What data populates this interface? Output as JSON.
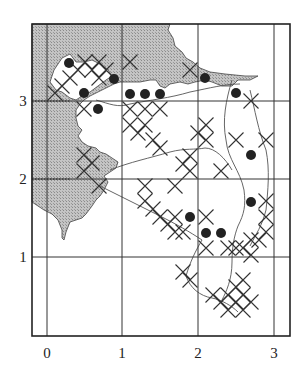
{
  "map": {
    "type": "grid-distribution-map",
    "frame": {
      "left": 32,
      "top": 24,
      "right": 290,
      "bottom": 336
    },
    "x_ticks": [
      {
        "label": "0",
        "px": 47
      },
      {
        "label": "1",
        "px": 122
      },
      {
        "label": "2",
        "px": 198
      },
      {
        "label": "3",
        "px": 274
      }
    ],
    "y_ticks": [
      {
        "label": "3",
        "py": 101
      },
      {
        "label": "2",
        "py": 179
      },
      {
        "label": "1",
        "py": 257
      }
    ],
    "colors": {
      "frame": "#222222",
      "grid": "#333333",
      "land_shade": "#b8b8b8",
      "coast_line": "#444444",
      "cross": "#333333",
      "dot": "#222222"
    },
    "legend": {
      "dot_meaning": "filled circle record",
      "cross_meaning": "cross record"
    },
    "dots": [
      {
        "x": 69,
        "y": 63
      },
      {
        "x": 84,
        "y": 93
      },
      {
        "x": 114,
        "y": 79
      },
      {
        "x": 98,
        "y": 109
      },
      {
        "x": 130,
        "y": 94
      },
      {
        "x": 145,
        "y": 94
      },
      {
        "x": 160,
        "y": 94
      },
      {
        "x": 205,
        "y": 78
      },
      {
        "x": 236,
        "y": 93
      },
      {
        "x": 251,
        "y": 155
      },
      {
        "x": 190,
        "y": 217
      },
      {
        "x": 206,
        "y": 233
      },
      {
        "x": 221,
        "y": 233
      },
      {
        "x": 251,
        "y": 202
      }
    ],
    "crosses": [
      {
        "x": 85,
        "y": 62
      },
      {
        "x": 99,
        "y": 62
      },
      {
        "x": 92,
        "y": 70
      },
      {
        "x": 106,
        "y": 70
      },
      {
        "x": 78,
        "y": 70
      },
      {
        "x": 70,
        "y": 78
      },
      {
        "x": 99,
        "y": 78
      },
      {
        "x": 62,
        "y": 86
      },
      {
        "x": 55,
        "y": 93
      },
      {
        "x": 130,
        "y": 62
      },
      {
        "x": 190,
        "y": 70
      },
      {
        "x": 251,
        "y": 101
      },
      {
        "x": 84,
        "y": 109
      },
      {
        "x": 130,
        "y": 109
      },
      {
        "x": 145,
        "y": 109
      },
      {
        "x": 160,
        "y": 109
      },
      {
        "x": 130,
        "y": 125
      },
      {
        "x": 138,
        "y": 133
      },
      {
        "x": 145,
        "y": 125
      },
      {
        "x": 153,
        "y": 140
      },
      {
        "x": 160,
        "y": 148
      },
      {
        "x": 206,
        "y": 125
      },
      {
        "x": 206,
        "y": 140
      },
      {
        "x": 198,
        "y": 133
      },
      {
        "x": 236,
        "y": 140
      },
      {
        "x": 266,
        "y": 140
      },
      {
        "x": 221,
        "y": 171
      },
      {
        "x": 190,
        "y": 156
      },
      {
        "x": 190,
        "y": 171
      },
      {
        "x": 183,
        "y": 164
      },
      {
        "x": 84,
        "y": 155
      },
      {
        "x": 84,
        "y": 171
      },
      {
        "x": 92,
        "y": 163
      },
      {
        "x": 99,
        "y": 186
      },
      {
        "x": 145,
        "y": 186
      },
      {
        "x": 175,
        "y": 186
      },
      {
        "x": 145,
        "y": 201
      },
      {
        "x": 153,
        "y": 209
      },
      {
        "x": 160,
        "y": 217
      },
      {
        "x": 168,
        "y": 224
      },
      {
        "x": 175,
        "y": 217
      },
      {
        "x": 175,
        "y": 232
      },
      {
        "x": 183,
        "y": 232
      },
      {
        "x": 206,
        "y": 217
      },
      {
        "x": 206,
        "y": 248
      },
      {
        "x": 266,
        "y": 201
      },
      {
        "x": 266,
        "y": 232
      },
      {
        "x": 266,
        "y": 217
      },
      {
        "x": 259,
        "y": 240
      },
      {
        "x": 243,
        "y": 248
      },
      {
        "x": 251,
        "y": 240
      },
      {
        "x": 236,
        "y": 248
      },
      {
        "x": 228,
        "y": 248
      },
      {
        "x": 251,
        "y": 255
      },
      {
        "x": 190,
        "y": 280
      },
      {
        "x": 183,
        "y": 272
      },
      {
        "x": 213,
        "y": 295
      },
      {
        "x": 221,
        "y": 302
      },
      {
        "x": 228,
        "y": 295
      },
      {
        "x": 236,
        "y": 302
      },
      {
        "x": 243,
        "y": 295
      },
      {
        "x": 236,
        "y": 287
      },
      {
        "x": 228,
        "y": 310
      },
      {
        "x": 243,
        "y": 310
      },
      {
        "x": 251,
        "y": 302
      },
      {
        "x": 243,
        "y": 280
      }
    ]
  }
}
